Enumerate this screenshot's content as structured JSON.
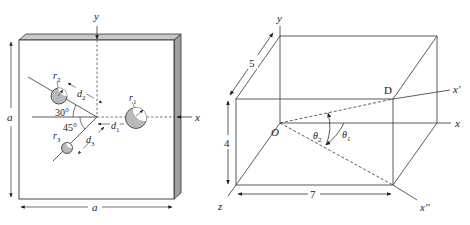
{
  "left_figure": {
    "description": "Square plate of side a with three circular holes",
    "axis_labels": {
      "y": "y",
      "x": "x"
    },
    "dimension_labels": {
      "height": "a",
      "width": "a"
    },
    "holes": [
      {
        "radius_label": "r",
        "radius_sub": "1",
        "distance_label": "d",
        "distance_sub": "1"
      },
      {
        "radius_label": "r",
        "radius_sub": "2",
        "distance_label": "d",
        "distance_sub": "2"
      },
      {
        "radius_label": "r",
        "radius_sub": "3",
        "distance_label": "d",
        "distance_sub": "3"
      }
    ],
    "angles": {
      "upper": "30°",
      "lower": "45°"
    },
    "colors": {
      "hole_fill": "#b9b9b9",
      "plate_edge": "#9a9a9a",
      "line": "#333333"
    }
  },
  "right_figure": {
    "description": "Rectangular box with axes and rotated directions",
    "axis_labels": {
      "y": "y",
      "x": "x",
      "z": "z",
      "x_prime": "x'",
      "x_double_prime": "x''"
    },
    "point_labels": {
      "origin": "O",
      "corner": "D"
    },
    "dimensions": {
      "depth": "5",
      "height": "4",
      "width": "7"
    },
    "angles": {
      "theta1_label": "θ",
      "theta1_sub": "1",
      "theta2_label": "θ",
      "theta2_sub": "2"
    }
  }
}
